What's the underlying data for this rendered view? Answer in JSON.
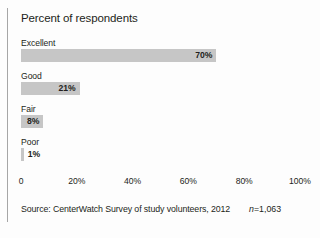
{
  "chart_data": {
    "type": "bar",
    "orientation": "horizontal",
    "title": "Percent of respondents",
    "xlabel": "",
    "ylabel": "",
    "categories": [
      "Excellent",
      "Good",
      "Fair",
      "Poor"
    ],
    "values": [
      70,
      21,
      8,
      1
    ],
    "value_labels": [
      "70%",
      "21%",
      "8%",
      "1%"
    ],
    "xlim": [
      0,
      100
    ],
    "xticks": [
      0,
      20,
      40,
      60,
      80,
      100
    ],
    "xtick_labels": [
      "0",
      "20%",
      "40%",
      "60%",
      "80%",
      "100%"
    ],
    "grid": false,
    "legend": false,
    "bar_color": "#c6c6c6",
    "text_color": "#231f20"
  },
  "figure": {
    "title": "Percent of respondents",
    "bars": [
      {
        "label": "Excellent",
        "value": 70,
        "value_label": "70%",
        "label_position": "inside"
      },
      {
        "label": "Good",
        "value": 21,
        "value_label": "21%",
        "label_position": "inside"
      },
      {
        "label": "Fair",
        "value": 8,
        "value_label": "8%",
        "label_position": "inside"
      },
      {
        "label": "Poor",
        "value": 1,
        "value_label": "1%",
        "label_position": "outside"
      }
    ],
    "axis": {
      "ticks": [
        {
          "label": "0",
          "value": 0
        },
        {
          "label": "20%",
          "value": 20
        },
        {
          "label": "40%",
          "value": 40
        },
        {
          "label": "60%",
          "value": 60
        },
        {
          "label": "80%",
          "value": 80
        },
        {
          "label": "100%",
          "value": 100
        }
      ]
    },
    "source": "Source: CenterWatch Survey of study volunteers, 2012",
    "sample_size_prefix": "n",
    "sample_size_value": "=1,063"
  }
}
